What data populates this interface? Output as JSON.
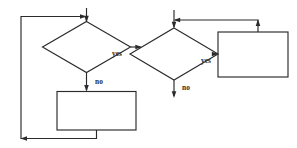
{
  "figure": {
    "background_color": "#ffffff",
    "stroke_color": "#2b2b2b",
    "label_color": "#2b2b2b"
  },
  "diagrams": [
    {
      "id": "left-diagram",
      "name": "repeat-until-loop",
      "decision": {
        "name": "decision-diamond",
        "label": "",
        "cx": 86,
        "cy": 47,
        "half_width": 44,
        "half_height": 26
      },
      "process": {
        "name": "process-box",
        "label": "",
        "x": 57,
        "y": 92,
        "width": 79,
        "height": 38
      },
      "edges": [
        {
          "name": "entry-edge",
          "label": "",
          "from": "top",
          "to": "decision",
          "direction": "down"
        },
        {
          "name": "yes-edge",
          "label": "yes",
          "from": "decision",
          "to": "exit",
          "direction": "right"
        },
        {
          "name": "no-edge",
          "label": "no",
          "from": "decision",
          "to": "process",
          "direction": "down"
        },
        {
          "name": "feedback-edge",
          "label": "",
          "from": "process",
          "to": "decision",
          "direction": "left-up-right"
        }
      ]
    },
    {
      "id": "right-diagram",
      "name": "while-loop",
      "decision": {
        "name": "decision-diamond",
        "label": "",
        "cx": 185,
        "cy": 53,
        "half_width": 44,
        "half_height": 26
      },
      "process": {
        "name": "process-box",
        "label": "",
        "x": 218,
        "y": 32,
        "width": 70,
        "height": 45
      },
      "edges": [
        {
          "name": "entry-edge",
          "label": "",
          "from": "top",
          "to": "decision",
          "direction": "down"
        },
        {
          "name": "yes-edge",
          "label": "yes",
          "from": "decision",
          "to": "process",
          "direction": "right"
        },
        {
          "name": "no-edge",
          "label": "no",
          "from": "decision",
          "to": "exit",
          "direction": "down"
        },
        {
          "name": "feedback-edge",
          "label": "",
          "from": "process",
          "to": "decision",
          "direction": "up-left"
        }
      ]
    }
  ],
  "labels": {
    "left_yes": "yes",
    "left_no": "no",
    "right_yes": "yes",
    "right_no": "no"
  }
}
